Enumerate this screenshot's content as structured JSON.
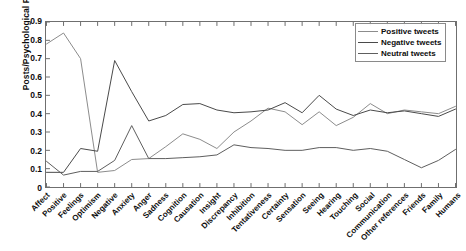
{
  "chart_data": {
    "type": "line",
    "title": "",
    "xlabel": "",
    "ylabel": "Posts/Psychological Processes",
    "ylim": [
      0,
      0.9
    ],
    "yticks": [
      "0",
      "0.1",
      "0.2",
      "0.3",
      "0.4",
      "0.5",
      "0.6",
      "0.7",
      "0.8",
      "0.9"
    ],
    "grid": false,
    "legend_position": "top-right",
    "categories": [
      "Affect",
      "Positive",
      "Feelings",
      "Optimism",
      "Negative",
      "Anxiety",
      "Anger",
      "Sadness",
      "Cognition",
      "Causation",
      "Insight",
      "Discrepancy",
      "Inhibition",
      "Tentativeness",
      "Certainty",
      "Sensation",
      "Seeing",
      "Hearing",
      "Touching",
      "Social",
      "Communication",
      "Other references",
      "Friends",
      "Family",
      "Humans"
    ],
    "series": [
      {
        "name": "Positive tweets",
        "color": "#8c8c8c",
        "values": [
          0.78,
          0.84,
          0.7,
          0.08,
          0.09,
          0.15,
          0.155,
          0.22,
          0.29,
          0.26,
          0.21,
          0.3,
          0.36,
          0.43,
          0.41,
          0.34,
          0.41,
          0.335,
          0.38,
          0.455,
          0.4,
          0.42,
          0.41,
          0.4,
          0.44
        ]
      },
      {
        "name": "Negative tweets",
        "color": "#4a4a4a",
        "values": [
          0.08,
          0.08,
          0.21,
          0.195,
          0.69,
          0.52,
          0.36,
          0.39,
          0.45,
          0.455,
          0.42,
          0.405,
          0.41,
          0.42,
          0.46,
          0.405,
          0.5,
          0.425,
          0.39,
          0.42,
          0.405,
          0.415,
          0.4,
          0.385,
          0.425
        ]
      },
      {
        "name": "Neutral tweets",
        "color": "#5e5e5e",
        "values": [
          0.14,
          0.065,
          0.085,
          0.085,
          0.145,
          0.335,
          0.155,
          0.155,
          0.16,
          0.165,
          0.175,
          0.23,
          0.215,
          0.21,
          0.2,
          0.2,
          0.215,
          0.215,
          0.2,
          0.21,
          0.195,
          0.15,
          0.105,
          0.145,
          0.205
        ]
      }
    ]
  },
  "legend": {
    "items": [
      {
        "label": "Positive tweets"
      },
      {
        "label": "Negative tweets"
      },
      {
        "label": "Neutral tweets"
      }
    ]
  }
}
